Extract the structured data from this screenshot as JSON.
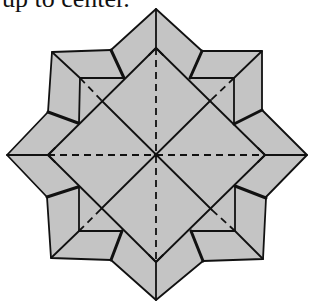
{
  "caption": {
    "text": "up to center."
  },
  "diagram": {
    "fill_color": "#c4c4c4",
    "line_color": "#111111",
    "center": [
      156,
      155
    ],
    "star_points": {
      "top": [
        156,
        9
      ],
      "right": [
        307,
        155
      ],
      "bottom": [
        156,
        300
      ],
      "left": [
        7,
        155
      ]
    },
    "corner_flaps": [
      "top-left",
      "top-right",
      "bottom-left",
      "bottom-right"
    ],
    "fold_lines": {
      "valley_dashed": [
        "vertical center crease",
        "horizontal center crease",
        "corner diagonal segments"
      ],
      "solid": [
        "main diagonals",
        "rotated inner square edges"
      ]
    }
  }
}
